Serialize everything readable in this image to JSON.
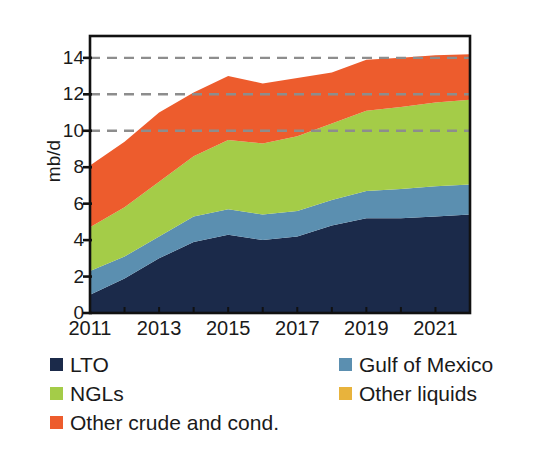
{
  "chart_data": {
    "type": "area",
    "stacked": true,
    "title": "",
    "xlabel": "",
    "ylabel": "mb/d",
    "x": [
      2011,
      2012,
      2013,
      2014,
      2015,
      2016,
      2017,
      2018,
      2019,
      2020,
      2021,
      2022
    ],
    "xtick_labels": [
      "2011",
      "2013",
      "2015",
      "2017",
      "2019",
      "2021"
    ],
    "xticks": [
      2011,
      2013,
      2015,
      2017,
      2019,
      2021
    ],
    "xlim": [
      2011,
      2022
    ],
    "ytick_labels": [
      "0",
      "2",
      "4",
      "6",
      "8",
      "10",
      "12",
      "14"
    ],
    "yticks": [
      0,
      2,
      4,
      6,
      8,
      10,
      12,
      14
    ],
    "ylim": [
      0,
      15.2
    ],
    "gridlines": [
      10,
      12,
      14
    ],
    "grid": "dashed-horizontal",
    "legend_position": "below",
    "series": [
      {
        "name": "LTO",
        "color": "#1b2a4a",
        "values": [
          1.0,
          1.9,
          3.0,
          3.9,
          4.3,
          4.0,
          4.2,
          4.8,
          5.2,
          5.2,
          5.3,
          5.4
        ]
      },
      {
        "name": "Gulf of Mexico",
        "color": "#5b8fb0",
        "values": [
          1.3,
          1.2,
          1.2,
          1.4,
          1.4,
          1.4,
          1.4,
          1.4,
          1.5,
          1.6,
          1.65,
          1.65
        ]
      },
      {
        "name": "NGLs",
        "color": "#a4cc48",
        "values": [
          2.4,
          2.7,
          3.0,
          3.3,
          3.8,
          3.9,
          4.1,
          4.2,
          4.4,
          4.5,
          4.6,
          4.65
        ]
      },
      {
        "name": "Other liquids",
        "color": "#e8b33c",
        "values": [
          0.0,
          0.0,
          0.0,
          0.0,
          0.0,
          0.0,
          0.0,
          0.0,
          0.0,
          0.0,
          0.0,
          0.0
        ]
      },
      {
        "name": "Other crude and cond.",
        "color": "#ed5c2d",
        "values": [
          3.4,
          3.6,
          3.8,
          3.5,
          3.5,
          3.3,
          3.2,
          2.8,
          2.8,
          2.7,
          2.6,
          2.5
        ]
      }
    ],
    "totals": [
      8.1,
      9.4,
      11.0,
      12.1,
      13.0,
      12.6,
      12.9,
      13.2,
      13.9,
      14.0,
      14.15,
      14.2
    ]
  },
  "axis": {
    "ylabel": "mb/d"
  },
  "legend": {
    "items": [
      {
        "label": "LTO",
        "color": "#1b2a4a"
      },
      {
        "label": "Gulf of Mexico",
        "color": "#5b8fb0"
      },
      {
        "label": "NGLs",
        "color": "#a4cc48"
      },
      {
        "label": "Other liquids",
        "color": "#e8b33c"
      },
      {
        "label": "Other crude and cond.",
        "color": "#ed5c2d"
      }
    ]
  }
}
